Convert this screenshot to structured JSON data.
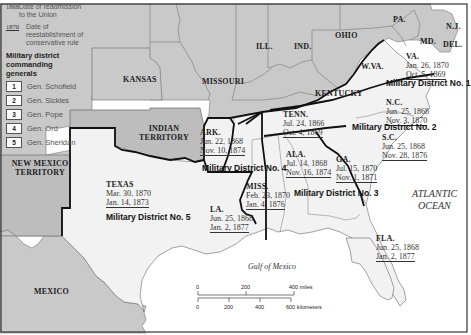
{
  "legend": {
    "readmission": {
      "year": "1868",
      "text": "Date of readmission to the Union"
    },
    "conservative": {
      "year": "1870",
      "text": "Date of reestablishment of conservative rule"
    },
    "heading": "Military district commanding generals",
    "generals": [
      {
        "num": "1",
        "name": "Gen. Schofield"
      },
      {
        "num": "2",
        "name": "Gen. Sickles"
      },
      {
        "num": "3",
        "name": "Gen. Pope"
      },
      {
        "num": "4",
        "name": "Gen. Ord"
      },
      {
        "num": "5",
        "name": "Gen. Sheridan"
      }
    ]
  },
  "states": {
    "kansas": "KANSAS",
    "missouri": "MISSOURI",
    "ill": "ILL.",
    "ind": "IND.",
    "ohio": "OHIO",
    "pa": "PA.",
    "nj": "N.J.",
    "md": "MD.",
    "del": "DEL.",
    "wva": "W.VA.",
    "kentucky": "KENTUCKY",
    "indian": "INDIAN TERRITORY",
    "newmexico": "NEW MEXICO TERRITORY",
    "mexico": "MEXICO"
  },
  "confederate": {
    "va": {
      "name": "VA.",
      "readmit": "Jan. 26, 1870",
      "conservative": "Oct. 5, 1869"
    },
    "nc": {
      "name": "N.C.",
      "readmit": "Jun. 25, 1868",
      "conservative": "Nov. 3, 1870"
    },
    "sc": {
      "name": "S.C.",
      "readmit": "Jun. 25, 1868",
      "conservative": "Nov. 28, 1876"
    },
    "ga": {
      "name": "GA.",
      "readmit": "Jul. 15, 1870",
      "conservative": "Nov. 1, 1871"
    },
    "fla": {
      "name": "FLA.",
      "readmit": "Jun. 25, 1868",
      "conservative": "Jan. 2, 1877"
    },
    "ala": {
      "name": "ALA.",
      "readmit": "Jul. 14, 1868",
      "conservative": "Nov. 16, 1874"
    },
    "miss": {
      "name": "MISS.",
      "readmit": "Feb. 23, 1870",
      "conservative": "Jan. 4, 1876"
    },
    "la": {
      "name": "LA.",
      "readmit": "Jun. 25, 1868",
      "conservative": "Jan. 2, 1877"
    },
    "ark": {
      "name": "ARK.",
      "readmit": "Jun. 22, 1868",
      "conservative": "Nov. 10, 1874"
    },
    "tenn": {
      "name": "TENN.",
      "readmit": "Jul. 24, 1866",
      "conservative": "Oct. 4, 1869"
    },
    "texas": {
      "name": "TEXAS",
      "readmit": "Mar. 30, 1870",
      "conservative": "Jan. 14, 1873"
    }
  },
  "districts": {
    "d1": "Military District No. 1",
    "d2": "Military District No. 2",
    "d3": "Military District No. 3",
    "d4": "Military District No. 4",
    "d5": "Military District No. 5"
  },
  "water": {
    "atlantic1": "ATLANTIC",
    "atlantic2": "OCEAN",
    "gulf": "Gulf of Mexico"
  },
  "scale": {
    "miles": [
      "0",
      "200",
      "400 miles"
    ],
    "km": [
      "0",
      "200",
      "400",
      "600 kilometers"
    ]
  },
  "colors": {
    "union_fill": "#c8c8c8",
    "confederate_fill": "#f2f2f2",
    "water": "#ffffff",
    "district_border": "#111111"
  }
}
